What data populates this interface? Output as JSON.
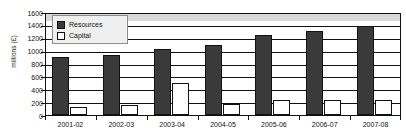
{
  "chart_data": {
    "type": "bar",
    "title": "",
    "xlabel": "",
    "ylabel": "millions (£)",
    "ylim": [
      0,
      1600
    ],
    "ytick_values": [
      0,
      200,
      400,
      600,
      800,
      1000,
      1200,
      1400,
      1600
    ],
    "ytick_labels": [
      "0",
      "200",
      "400",
      "600",
      "800",
      "1000",
      "1200",
      "1400",
      "1600"
    ],
    "grid": true,
    "legend_position": "upper-left-inside",
    "categories": [
      "2001-02",
      "2002-03",
      "2003-04",
      "2004-05",
      "2005-06",
      "2006-07",
      "2007-08"
    ],
    "series": [
      {
        "name": "Resources",
        "color": "#3a3a3a",
        "values": [
          900,
          930,
          1030,
          1080,
          1250,
          1300,
          1390
        ]
      },
      {
        "name": "Capital",
        "color": "#ffffff",
        "values": [
          130,
          150,
          500,
          170,
          230,
          240,
          230
        ]
      }
    ]
  },
  "legend": {
    "items": [
      {
        "label": "Resources",
        "swatch": "filled-dark-square-icon"
      },
      {
        "label": "Capital",
        "swatch": "empty-white-square-icon"
      }
    ]
  }
}
